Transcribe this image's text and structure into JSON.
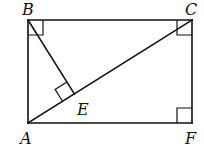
{
  "diagram": {
    "type": "geometry",
    "points": {
      "A": {
        "label": "A",
        "x": 28,
        "y": 123
      },
      "B": {
        "label": "B",
        "x": 28,
        "y": 20
      },
      "C": {
        "label": "C",
        "x": 192,
        "y": 20
      },
      "F": {
        "label": "F",
        "x": 192,
        "y": 123
      },
      "E": {
        "label": "E",
        "x": 74.4,
        "y": 93.9
      }
    },
    "segments": [
      "AB",
      "BC",
      "CF",
      "FA",
      "AC",
      "BE"
    ],
    "right_angles": [
      "B",
      "C",
      "F",
      "E"
    ],
    "labels": {
      "A": "A",
      "B": "B",
      "C": "C",
      "E": "E",
      "F": "F"
    }
  }
}
